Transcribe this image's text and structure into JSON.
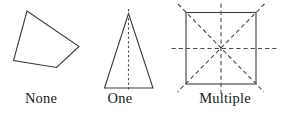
{
  "diagram": {
    "topic": "lines of symmetry",
    "shapes": [
      {
        "name": "irregular-quadrilateral",
        "label": "None",
        "symmetry_lines_shown": 0
      },
      {
        "name": "isosceles-triangle",
        "label": "One",
        "symmetry_lines_shown": 1
      },
      {
        "name": "square",
        "label": "Multiple",
        "symmetry_lines_shown": 4
      }
    ],
    "colors": {
      "outline": "#3d3d3d",
      "symmetry_line": "#4a4a4a",
      "text": "#212121",
      "background": "#ffffff"
    }
  }
}
